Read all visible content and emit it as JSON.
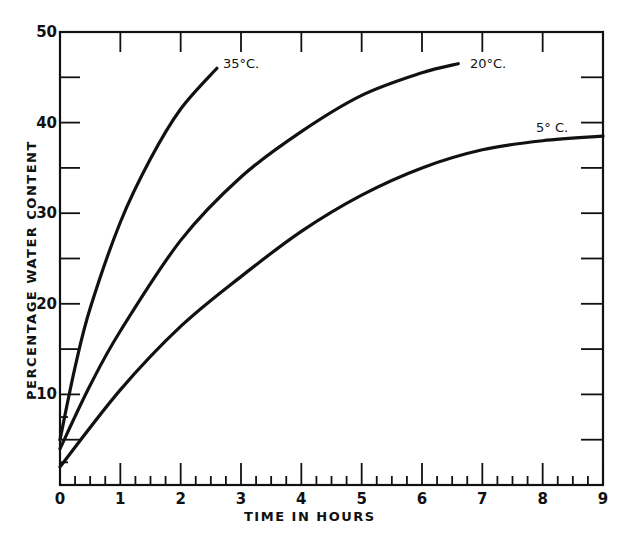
{
  "chart_data": {
    "type": "line",
    "title": "",
    "xlabel": "TIME IN HOURS",
    "ylabel": "PERCENTAGE WATER CONTENT",
    "xlim": [
      0,
      9
    ],
    "ylim": [
      0,
      50
    ],
    "x_ticks": [
      "0",
      "1",
      "2",
      "3",
      "4",
      "5",
      "6",
      "7",
      "8",
      "9"
    ],
    "y_ticks": [
      "10",
      "20",
      "30",
      "40",
      "50"
    ],
    "grid": false,
    "legend": "inline curve labels",
    "series": [
      {
        "name": "35°C.",
        "x": [
          0,
          0.25,
          0.5,
          1.0,
          1.5,
          2.0,
          2.6
        ],
        "y": [
          5,
          13,
          19.5,
          29,
          36,
          41.5,
          46
        ]
      },
      {
        "name": "20°C.",
        "x": [
          0,
          0.5,
          1,
          2,
          3,
          4,
          5,
          6,
          6.6
        ],
        "y": [
          4,
          11,
          17,
          27,
          34,
          39,
          43,
          45.5,
          46.5
        ]
      },
      {
        "name": "5° C.",
        "x": [
          0,
          1,
          2,
          3,
          4,
          5,
          6,
          7,
          8,
          9
        ],
        "y": [
          2,
          10.5,
          17.5,
          23,
          28,
          32,
          35,
          37,
          38,
          38.5
        ]
      }
    ]
  },
  "labels": {
    "xlabel": "TIME IN HOURS",
    "ylabel": "PERCENTAGE WATER CONTENT",
    "curve_35": "35°C.",
    "curve_20": "20°C.",
    "curve_5": "5°  C."
  }
}
